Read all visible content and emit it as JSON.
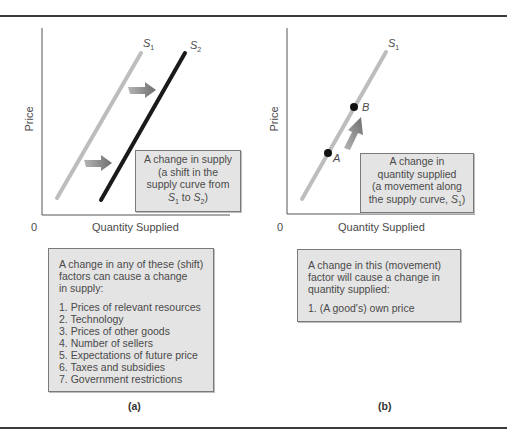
{
  "figure": {
    "panels": [
      {
        "id": "a",
        "caption": "(a)",
        "y_axis_label": "Price",
        "x_axis_label": "Quantity Supplied",
        "origin_label": "0",
        "curves": [
          {
            "name": "S",
            "subscript": "1",
            "color": "#bdbdbd"
          },
          {
            "name": "S",
            "subscript": "2",
            "color": "#1a1a1a"
          }
        ],
        "callout": {
          "lines": [
            "A change in supply",
            "(a shift in the",
            "supply curve from"
          ],
          "last_line": {
            "s1": "S",
            "s1_sub": "1",
            "mid": " to ",
            "s2": "S",
            "s2_sub": "2",
            "end": ")"
          }
        },
        "factors_box": {
          "intro": [
            "A change in any of these (shift)",
            "factors can cause a change",
            "in supply:"
          ],
          "items": [
            "1. Prices of relevant resources",
            "2. Technology",
            "3. Prices of other goods",
            "4. Number of sellers",
            "5. Expectations of future price",
            "6. Taxes and subsidies",
            "7. Government restrictions"
          ]
        }
      },
      {
        "id": "b",
        "caption": "(b)",
        "y_axis_label": "Price",
        "x_axis_label": "Quantity Supplied",
        "origin_label": "0",
        "curves": [
          {
            "name": "S",
            "subscript": "1",
            "color": "#bdbdbd"
          }
        ],
        "points": [
          {
            "label": "A"
          },
          {
            "label": "B"
          }
        ],
        "callout": {
          "lines": [
            "A change in",
            "quantity supplied",
            "(a movement along"
          ],
          "last_line": {
            "pre": "the supply curve, ",
            "s1": "S",
            "s1_sub": "1",
            "end": ")"
          }
        },
        "factors_box": {
          "intro": [
            "A change in this (movement)",
            "factor will cause a change in",
            "quantity supplied:"
          ],
          "items": [
            "1. (A good's) own price"
          ]
        }
      }
    ],
    "colors": {
      "rule": "#3a3a3a",
      "axis": "#555555",
      "s1_line": "#bdbdbd",
      "s2_line": "#1a1a1a",
      "arrow": "#7d7d7d",
      "box_fill": "#e4e4e4",
      "box_border": "#7a7a7a",
      "point": "#111111"
    }
  }
}
